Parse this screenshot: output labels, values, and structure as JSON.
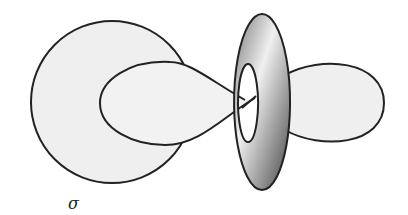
{
  "figure": {
    "label": "σ",
    "shapes": [
      "large-circle",
      "figure-eight-curve",
      "torus",
      "right-lobe"
    ],
    "colors": {
      "stroke": "#222222",
      "fill_light": "#ececec",
      "torus_dark": "#555555",
      "torus_light": "#eeeeee"
    }
  }
}
